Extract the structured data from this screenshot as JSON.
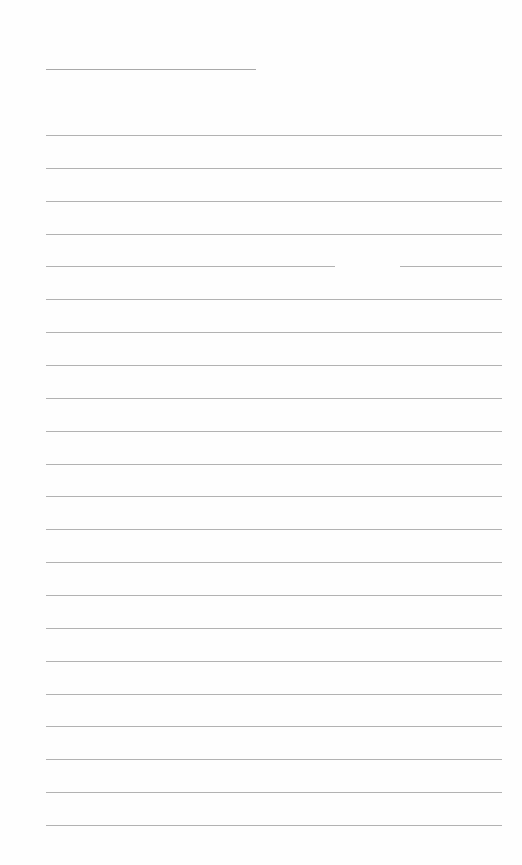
{
  "page": {
    "type": "lined-paper",
    "background_color": "#fefefe",
    "line_color": "#b2b2b2"
  },
  "title_line": {
    "text": "",
    "x": 46,
    "y": 69,
    "width": 210
  },
  "ruled_lines": {
    "count": 22,
    "start_y": 135,
    "end_y": 825,
    "x": 46,
    "width": 456,
    "entries": [
      "",
      "",
      "",
      "",
      "",
      "",
      "",
      "",
      "",
      "",
      "",
      "",
      "",
      "",
      "",
      "",
      "",
      "",
      "",
      "",
      "",
      ""
    ],
    "gaps": [
      {
        "line_index": 4,
        "from_x": 335,
        "to_x": 400
      }
    ]
  }
}
